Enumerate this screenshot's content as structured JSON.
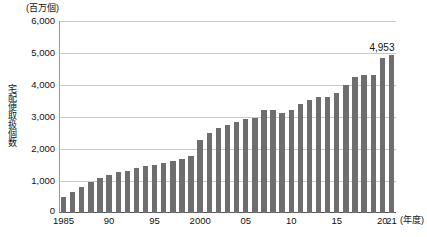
{
  "chart_data": {
    "type": "bar",
    "title": "",
    "unit_caption": "(百万個)",
    "ylabel": "宅配便取扱個数",
    "xlabel": "(年度)",
    "ylim": [
      0,
      6000
    ],
    "y_ticks": [
      "0",
      "1,000",
      "2,000",
      "3,000",
      "4,000",
      "5,000",
      "6,000"
    ],
    "y_tick_values": [
      0,
      1000,
      2000,
      3000,
      4000,
      5000,
      6000
    ],
    "grid": true,
    "legend": "none",
    "zero_label": "0",
    "x_tick_labels": [
      "1985",
      "90",
      "95",
      "2000",
      "05",
      "10",
      "15",
      "20",
      "21"
    ],
    "x_tick_categories": [
      1985,
      1990,
      1995,
      2000,
      2005,
      2010,
      2015,
      2020,
      2021
    ],
    "categories": [
      1985,
      1986,
      1987,
      1988,
      1989,
      1990,
      1991,
      1992,
      1993,
      1994,
      1995,
      1996,
      1997,
      1998,
      1999,
      2000,
      2001,
      2002,
      2003,
      2004,
      2005,
      2006,
      2007,
      2008,
      2009,
      2010,
      2011,
      2012,
      2013,
      2014,
      2015,
      2016,
      2017,
      2018,
      2019,
      2020,
      2021
    ],
    "values": [
      494,
      650,
      810,
      965,
      1100,
      1189,
      1275,
      1315,
      1410,
      1460,
      1495,
      1550,
      1620,
      1680,
      1775,
      2270,
      2500,
      2650,
      2750,
      2840,
      2930,
      2980,
      3210,
      3220,
      3140,
      3220,
      3400,
      3520,
      3630,
      3615,
      3740,
      4010,
      4250,
      4310,
      4320,
      4836,
      4953
    ],
    "peak_label": "4,953",
    "peak_category": 2021
  }
}
